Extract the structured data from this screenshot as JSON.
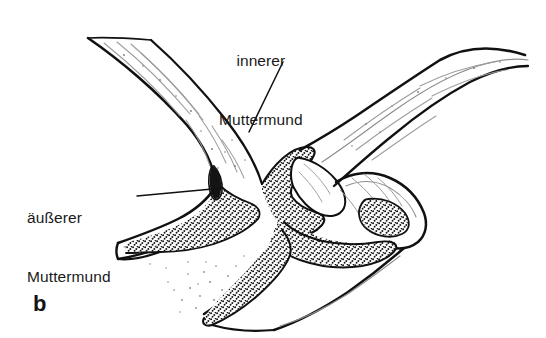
{
  "figure": {
    "panel_letter": "b",
    "background_color": "#ffffff",
    "ink_color": "#111111",
    "type": "line-drawing",
    "labels": [
      {
        "id": "inner-os",
        "line1": "innerer",
        "line2": "Muttermund",
        "leader": "line from label down-left to the cervical isthmus"
      },
      {
        "id": "outer-os",
        "line1": "äußerer",
        "line2": "Muttermund",
        "leader": "line from label right to the external os slit"
      }
    ]
  },
  "colors": {
    "ink": "#111111",
    "paper": "#ffffff",
    "stipple": "#1b1b1b",
    "hatch": "#9a9a9a"
  }
}
